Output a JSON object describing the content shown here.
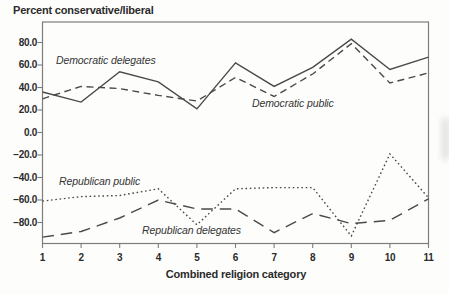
{
  "chart_data": {
    "type": "line",
    "title": "Percent conservative/liberal",
    "xlabel": "Combined religion category",
    "ylabel": "Percent conservative/liberal",
    "categories": [
      1,
      2,
      3,
      4,
      5,
      6,
      7,
      8,
      9,
      10,
      11
    ],
    "x_tick_labels": [
      "1",
      "2",
      "3",
      "4",
      "5",
      "6",
      "7",
      "8",
      "9",
      "10",
      "11"
    ],
    "y_ticks": [
      80,
      60,
      40,
      20,
      0,
      -20,
      -40,
      -60,
      -80
    ],
    "y_tick_labels": [
      "80.0",
      "60.0",
      "40.0",
      "20.0",
      "0.0",
      "−20.0",
      "−40.0",
      "−60.0",
      "−80.0"
    ],
    "ylim": [
      -100,
      98
    ],
    "grid": false,
    "legend_position": "inline-annotations",
    "line_color": "#4a4a4a",
    "frame_color": "#7d7d7d",
    "series": [
      {
        "name": "Democratic delegates",
        "line_style": "solid",
        "values": [
          36,
          27,
          54,
          45,
          21,
          62,
          41,
          58,
          83,
          56,
          67
        ]
      },
      {
        "name": "Democratic public",
        "line_style": "dashed",
        "values": [
          30,
          41,
          39,
          33,
          28,
          49,
          32,
          52,
          79,
          44,
          53
        ]
      },
      {
        "name": "Republican public",
        "line_style": "dotted",
        "values": [
          -61,
          -57,
          -56,
          -50,
          -82,
          -50,
          -49,
          -49,
          -92,
          -19,
          -58
        ]
      },
      {
        "name": "Republican delegates",
        "line_style": "long-dash",
        "values": [
          -93,
          -88,
          -76,
          -60,
          -68,
          -68,
          -89,
          -72,
          -81,
          -78,
          -59
        ]
      }
    ]
  }
}
